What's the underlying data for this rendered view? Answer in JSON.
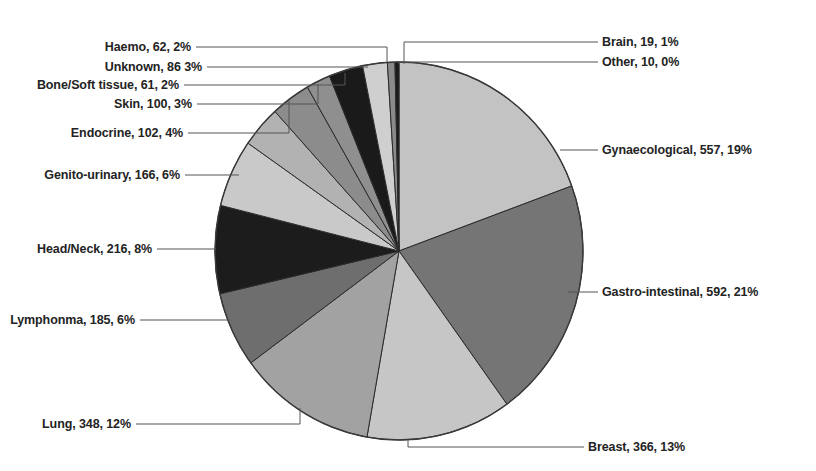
{
  "chart_data": {
    "type": "pie",
    "title": "",
    "subtitle": "",
    "xlabel": "",
    "ylabel": "",
    "legend_position": "callout-labels",
    "grid": false,
    "label_format": "name, count, percent",
    "total": 2904,
    "categories": [
      "Gynaecological",
      "Gastro-intestinal",
      "Breast",
      "Lung",
      "Lymphonma",
      "Head/Neck",
      "Genito-urinary",
      "Endocrine",
      "Skin",
      "Bone/Soft tissue",
      "Unknown",
      "Haemo",
      "Brain",
      "Other"
    ],
    "values": [
      557,
      592,
      366,
      348,
      185,
      216,
      166,
      102,
      100,
      61,
      86,
      62,
      19,
      10
    ],
    "percents": [
      19,
      21,
      13,
      12,
      6,
      8,
      6,
      4,
      3,
      2,
      3,
      2,
      1,
      0
    ],
    "colors": [
      "#c3c3c3",
      "#757575",
      "#c6c6c6",
      "#a2a2a2",
      "#6e6e6e",
      "#1c1c1c",
      "#c9c9c9",
      "#b2b2b2",
      "#8c8c8c",
      "#8f8f8f",
      "#1a1a1a",
      "#cfcfcf",
      "#8a8a8a",
      "#1a1a1a"
    ],
    "slices": [
      {
        "name": "Gynaecological",
        "value": 557,
        "percent": 19,
        "label": "Gynaecological, 557, 19%",
        "color": "#c3c3c3"
      },
      {
        "name": "Gastro-intestinal",
        "value": 592,
        "percent": 21,
        "label": "Gastro-intestinal, 592, 21%",
        "color": "#757575"
      },
      {
        "name": "Breast",
        "value": 366,
        "percent": 13,
        "label": "Breast, 366, 13%",
        "color": "#c6c6c6"
      },
      {
        "name": "Lung",
        "value": 348,
        "percent": 12,
        "label": "Lung, 348, 12%",
        "color": "#a2a2a2"
      },
      {
        "name": "Lymphonma",
        "value": 185,
        "percent": 6,
        "label": "Lymphonma, 185, 6%",
        "color": "#6e6e6e"
      },
      {
        "name": "Head/Neck",
        "value": 216,
        "percent": 8,
        "label": "Head/Neck, 216, 8%",
        "color": "#1c1c1c"
      },
      {
        "name": "Genito-urinary",
        "value": 166,
        "percent": 6,
        "label": "Genito-urinary, 166, 6%",
        "color": "#c9c9c9"
      },
      {
        "name": "Endocrine",
        "value": 102,
        "percent": 4,
        "label": "Endocrine, 102, 4%",
        "color": "#b2b2b2"
      },
      {
        "name": "Skin",
        "value": 100,
        "percent": 3,
        "label": "Skin, 100, 3%",
        "color": "#8c8c8c"
      },
      {
        "name": "Bone/Soft tissue",
        "value": 61,
        "percent": 2,
        "label": "Bone/Soft tissue, 61, 2%",
        "color": "#8f8f8f"
      },
      {
        "name": "Unknown",
        "value": 86,
        "percent": 3,
        "label": "Unknown, 86 3%",
        "color": "#1a1a1a"
      },
      {
        "name": "Haemo",
        "value": 62,
        "percent": 2,
        "label": "Haemo, 62, 2%",
        "color": "#cfcfcf"
      },
      {
        "name": "Brain",
        "value": 19,
        "percent": 1,
        "label": "Brain, 19, 1%",
        "color": "#8a8a8a"
      },
      {
        "name": "Other",
        "value": 10,
        "percent": 0,
        "label": "Other, 10, 0%",
        "color": "#1a1a1a"
      }
    ]
  },
  "labels": {
    "brain": "Brain, 19, 1%",
    "other": "Other, 10, 0%",
    "gynaecological": "Gynaecological, 557, 19%",
    "gastro_intestinal": "Gastro-intestinal, 592, 21%",
    "breast": "Breast, 366, 13%",
    "lung": "Lung, 348, 12%",
    "lymphonma": "Lymphonma, 185, 6%",
    "head_neck": "Head/Neck, 216, 8%",
    "genito_urinary": "Genito-urinary, 166, 6%",
    "endocrine": "Endocrine, 102, 4%",
    "skin": "Skin, 100, 3%",
    "bone_soft_tissue": "Bone/Soft tissue, 61, 2%",
    "unknown": "Unknown, 86 3%",
    "haemo": "Haemo, 62, 2%"
  }
}
